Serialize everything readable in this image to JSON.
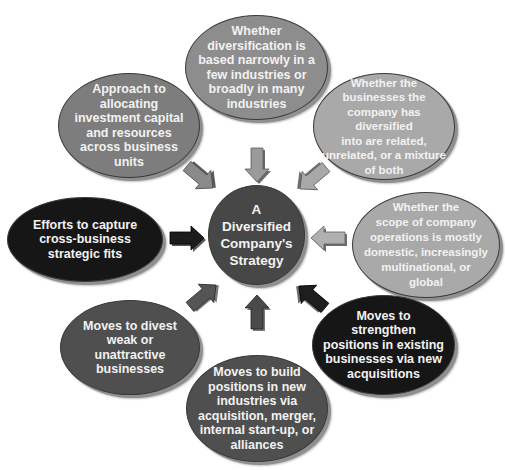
{
  "diagram": {
    "center": {
      "label": "A Diversified Company's Strategy",
      "lines": [
        "A",
        "Diversified",
        "Company's",
        "Strategy"
      ],
      "color": "#474747"
    },
    "nodes": [
      {
        "id": "breadth",
        "position": "top",
        "color": "#8d8d8d",
        "lines": [
          "Whether",
          "diversification is",
          "based narrowly in a",
          "few industries or",
          "broadly in many",
          "industries"
        ]
      },
      {
        "id": "relatedness",
        "position": "upper-right",
        "color": "#a9a9a9",
        "lines": [
          "Whether the",
          "businesses the",
          "company has diversified",
          "into are related,",
          "unrelated, or a mixture",
          "of both"
        ]
      },
      {
        "id": "geographic-scope",
        "position": "right",
        "color": "#a9a9a9",
        "lines": [
          "Whether the",
          "scope of company",
          "operations is mostly",
          "domestic, increasingly",
          "multinational, or",
          "global"
        ]
      },
      {
        "id": "strengthen-positions",
        "position": "lower-right",
        "color": "#161616",
        "lines": [
          "Moves to",
          "strengthen",
          "positions in existing",
          "businesses via new",
          "acquisitions"
        ]
      },
      {
        "id": "build-positions",
        "position": "bottom",
        "color": "#4f4f4f",
        "lines": [
          "Moves to build",
          "positions in new",
          "industries via",
          "acquisition, merger,",
          "internal start-up, or",
          "alliances"
        ]
      },
      {
        "id": "divest",
        "position": "lower-left",
        "color": "#4f4f4f",
        "lines": [
          "Moves to divest",
          "weak or",
          "unattractive",
          "businesses"
        ]
      },
      {
        "id": "strategic-fits",
        "position": "left",
        "color": "#161616",
        "lines": [
          "Efforts to capture",
          "cross-business",
          "strategic fits"
        ]
      },
      {
        "id": "capital-allocation",
        "position": "upper-left",
        "color": "#7d7d7d",
        "lines": [
          "Approach to",
          "allocating",
          "investment capital",
          "and resources",
          "across business",
          "units"
        ]
      }
    ],
    "arrows": [
      {
        "from": "breadth",
        "direction": "down",
        "color": "#9a9a9a"
      },
      {
        "from": "relatedness",
        "direction": "down-left",
        "color": "#a8a8a8"
      },
      {
        "from": "geographic-scope",
        "direction": "left",
        "color": "#b0b0b0"
      },
      {
        "from": "strengthen-positions",
        "direction": "up-left",
        "color": "#1e1e1e"
      },
      {
        "from": "build-positions",
        "direction": "up",
        "color": "#4a4a4a"
      },
      {
        "from": "divest",
        "direction": "up-right",
        "color": "#555555"
      },
      {
        "from": "strategic-fits",
        "direction": "right",
        "color": "#1c1c1c"
      },
      {
        "from": "capital-allocation",
        "direction": "down-right",
        "color": "#8a8a8a"
      }
    ]
  }
}
